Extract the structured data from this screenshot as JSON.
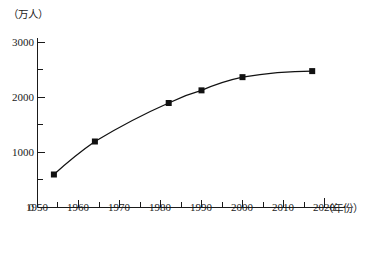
{
  "chart_data": {
    "type": "line",
    "title": "",
    "subtitle": "",
    "xlabel": "（年份）",
    "ylabel": "（万人）",
    "xlim": [
      1950,
      2020
    ],
    "ylim": [
      0,
      3000
    ],
    "grid": false,
    "legend": false,
    "legend_position": "none",
    "x_major_ticks": [
      1950,
      1960,
      1970,
      1980,
      1990,
      2000,
      2010,
      2020
    ],
    "x_minor_ticks": [
      1955,
      1965,
      1975,
      1985,
      1995,
      2005,
      2015
    ],
    "x_tick_labels": [
      "1950",
      "1960",
      "1970",
      "1980",
      "1990",
      "2000",
      "2010",
      "2020"
    ],
    "y_major_ticks": [
      0,
      1000,
      2000,
      3000
    ],
    "y_minor_ticks": [
      500,
      1500,
      2500
    ],
    "y_tick_labels": [
      "0",
      "1000",
      "2000",
      "3000"
    ],
    "marker": "square",
    "marker_color": "#111111",
    "line_color": "#111111",
    "series": [
      {
        "name": "人口",
        "x": [
          1954,
          1964,
          1982,
          1990,
          2000,
          2017
        ],
        "values": [
          600,
          1200,
          1900,
          2130,
          2370,
          2480
        ],
        "points": [
          {
            "x": 1954,
            "y": 600
          },
          {
            "x": 1964,
            "y": 1200
          },
          {
            "x": 1982,
            "y": 1900
          },
          {
            "x": 1990,
            "y": 2130
          },
          {
            "x": 2000,
            "y": 2370
          },
          {
            "x": 2017,
            "y": 2480
          }
        ]
      }
    ],
    "annotations": []
  }
}
